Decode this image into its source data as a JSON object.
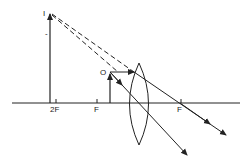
{
  "diagram": {
    "title": "",
    "labels": {
      "image": "I",
      "object": "O",
      "two_f_left": "2F",
      "f_left": "F",
      "f_right": "F",
      "tick_mark": "-"
    },
    "colors": {
      "line": "#222222",
      "background": "#ffffff"
    }
  }
}
